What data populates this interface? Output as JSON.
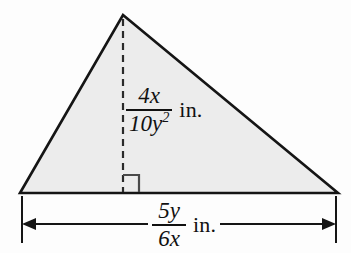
{
  "figure": {
    "name": "triangle-area-diagram",
    "shape": "triangle",
    "fill_color": "#ececec",
    "stroke_color": "#151515",
    "background_color": "#fdfdfd",
    "vertices": {
      "apex": [
        123,
        15
      ],
      "base_left": [
        20,
        193
      ],
      "base_right": [
        338,
        193
      ]
    },
    "altitude": {
      "from": [
        123,
        15
      ],
      "to": [
        123,
        193
      ],
      "style": "dashed",
      "right_angle_marker": true
    },
    "dimension_line": {
      "y": 224,
      "x_start": 22,
      "x_end": 336,
      "arrowheads": "both"
    }
  },
  "labels": {
    "height": {
      "name": "height-label",
      "numerator": "4x",
      "denominator": "10y",
      "denominator_exponent": "2",
      "unit": "in."
    },
    "base": {
      "name": "base-label",
      "numerator": "5y",
      "denominator": "6x",
      "unit": "in."
    }
  }
}
